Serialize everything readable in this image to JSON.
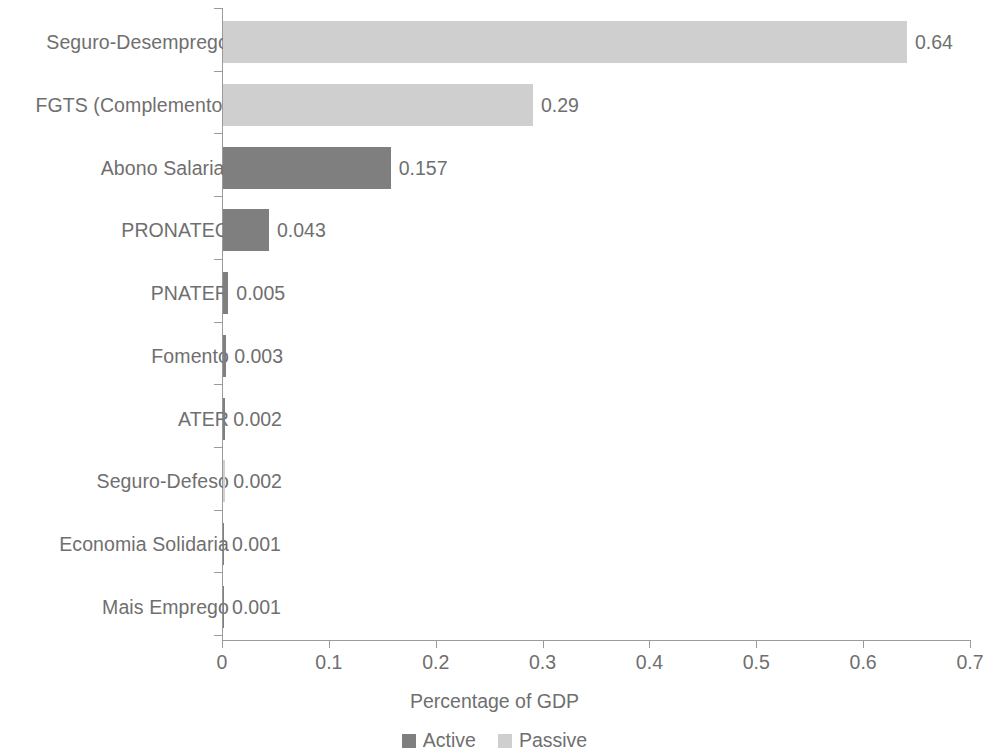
{
  "chart_data": {
    "type": "bar",
    "orientation": "horizontal",
    "title": "",
    "xlabel": "Percentage of GDP",
    "ylabel": "",
    "xlim": [
      0,
      0.7
    ],
    "grid": false,
    "legend_position": "bottom",
    "categories": [
      "Seguro-Desemprego",
      "FGTS (Complemento)",
      "Abono Salarial",
      "PRONATEC",
      "PNATER",
      "Fomento",
      "ATER",
      "Seguro-Defeso",
      "Economia Solidaria",
      "Mais Emprego"
    ],
    "values": [
      0.64,
      0.29,
      0.157,
      0.043,
      0.005,
      0.003,
      0.002,
      0.002,
      0.001,
      0.001
    ],
    "value_labels": [
      "0.64",
      "0.29",
      "0.157",
      "0.043",
      "0.005",
      "0.003",
      "0.002",
      "0.002",
      "0.001",
      "0.001"
    ],
    "series_of_bar": [
      "Passive",
      "Passive",
      "Active",
      "Active",
      "Active",
      "Active",
      "Active",
      "Passive",
      "Active",
      "Active"
    ],
    "series": [
      {
        "name": "Active",
        "color": "#7f7f7f"
      },
      {
        "name": "Passive",
        "color": "#cfcfcf"
      }
    ],
    "xticks": [
      0,
      0.1,
      0.2,
      0.3,
      0.4,
      0.5,
      0.6,
      0.7
    ],
    "xtick_labels": [
      "0",
      "0.1",
      "0.2",
      "0.3",
      "0.4",
      "0.5",
      "0.6",
      "0.7"
    ],
    "axis_color": "#9a9a9a",
    "text_color": "#6f6f6f"
  },
  "legend": {
    "items": [
      {
        "label": "Active",
        "series": "Active"
      },
      {
        "label": "Passive",
        "series": "Passive"
      }
    ]
  }
}
